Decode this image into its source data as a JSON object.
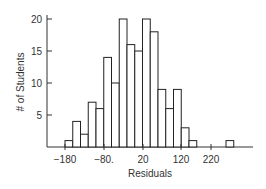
{
  "chart_data": {
    "type": "bar",
    "title": "",
    "xlabel": "Residuals",
    "ylabel": "# of Students",
    "bin_width": 20,
    "bins_start": [
      -180,
      -160,
      -140,
      -120,
      -100,
      -80,
      -60,
      -40,
      -20,
      0,
      20,
      40,
      60,
      80,
      100,
      120,
      140,
      160,
      180,
      200,
      220
    ],
    "values": [
      1,
      4,
      2,
      7,
      6,
      14,
      10,
      20,
      16,
      15,
      20,
      18,
      9,
      6,
      9,
      3,
      1,
      0,
      0,
      0,
      0
    ],
    "outlier_bin": {
      "label": "beyond 220",
      "value": 1
    },
    "x_tick_labels": [
      "−180",
      "−80.",
      "20",
      "120",
      "220"
    ],
    "y_tick_labels": [
      "5",
      "10",
      "15",
      "20"
    ],
    "ylim": [
      0,
      21
    ],
    "grid": false,
    "legend": null,
    "bar_fill": "#ffffff",
    "bar_stroke": "#222222"
  },
  "render": {
    "x0": 65,
    "bar_px": 7.75,
    "y0": 147,
    "unit_px": 6.4,
    "bars_x": [
      65,
      72.75,
      80.5,
      88.25,
      96,
      103.75,
      111.5,
      119.25,
      127,
      134.75,
      142.5,
      150.25,
      158,
      165.75,
      173.5,
      181.25,
      189
    ],
    "outlier_x": 226,
    "x_ticks_px": [
      65,
      104,
      143,
      181,
      211
    ],
    "y_ticks_px": [
      115,
      83,
      51,
      19
    ]
  }
}
